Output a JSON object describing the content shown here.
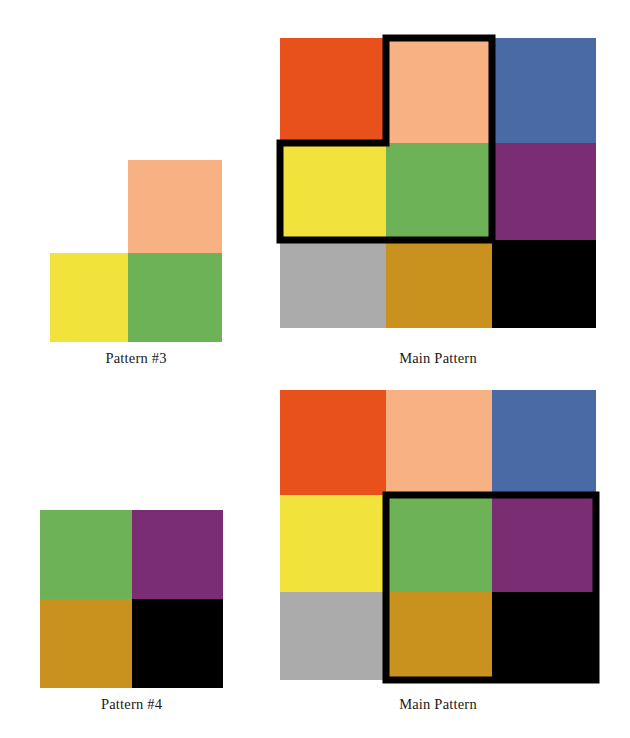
{
  "page": {
    "background": "#ffffff",
    "width": 630,
    "height": 738
  },
  "palette": {
    "orange_red": "#E8501C",
    "peach": "#F8B183",
    "blue": "#4A6AA5",
    "yellow": "#F2E23C",
    "green": "#6EB257",
    "purple": "#7A2D73",
    "gray": "#ABABAB",
    "gold": "#C9921F",
    "black": "#000000",
    "highlight_outline": "#000000"
  },
  "figures": [
    {
      "id": "pattern-3",
      "caption": "Pattern #3",
      "kind": "sub-pattern",
      "shape": "L-shape",
      "grid": {
        "rows": 2,
        "cols": 2
      },
      "tiles": [
        {
          "row": 0,
          "col": 0,
          "color": "none",
          "name": "empty"
        },
        {
          "row": 0,
          "col": 1,
          "color": "#F8B183",
          "name": "peach"
        },
        {
          "row": 1,
          "col": 0,
          "color": "#F2E23C",
          "name": "yellow"
        },
        {
          "row": 1,
          "col": 1,
          "color": "#6EB257",
          "name": "green"
        }
      ]
    },
    {
      "id": "main-pattern-top",
      "caption": "Main Pattern",
      "kind": "main-pattern",
      "grid": {
        "rows": 3,
        "cols": 3
      },
      "tiles": [
        {
          "row": 0,
          "col": 0,
          "color": "#E8501C",
          "name": "orange-red"
        },
        {
          "row": 0,
          "col": 1,
          "color": "#F8B183",
          "name": "peach"
        },
        {
          "row": 0,
          "col": 2,
          "color": "#4A6AA5",
          "name": "blue"
        },
        {
          "row": 1,
          "col": 0,
          "color": "#F2E23C",
          "name": "yellow"
        },
        {
          "row": 1,
          "col": 1,
          "color": "#6EB257",
          "name": "green"
        },
        {
          "row": 1,
          "col": 2,
          "color": "#7A2D73",
          "name": "purple"
        },
        {
          "row": 2,
          "col": 0,
          "color": "#ABABAB",
          "name": "gray"
        },
        {
          "row": 2,
          "col": 1,
          "color": "#C9921F",
          "name": "gold"
        },
        {
          "row": 2,
          "col": 2,
          "color": "#000000",
          "name": "black"
        }
      ],
      "highlight": {
        "shape": "L-shape",
        "covered_cells": [
          {
            "row": 0,
            "col": 1,
            "color": "#F8B183"
          },
          {
            "row": 1,
            "col": 0,
            "color": "#F2E23C"
          },
          {
            "row": 1,
            "col": 1,
            "color": "#6EB257"
          }
        ]
      }
    },
    {
      "id": "pattern-4",
      "caption": "Pattern #4",
      "kind": "sub-pattern",
      "shape": "square",
      "grid": {
        "rows": 2,
        "cols": 2
      },
      "tiles": [
        {
          "row": 0,
          "col": 0,
          "color": "#6EB257",
          "name": "green"
        },
        {
          "row": 0,
          "col": 1,
          "color": "#7A2D73",
          "name": "purple"
        },
        {
          "row": 1,
          "col": 0,
          "color": "#C9921F",
          "name": "gold"
        },
        {
          "row": 1,
          "col": 1,
          "color": "#000000",
          "name": "black"
        }
      ]
    },
    {
      "id": "main-pattern-bottom",
      "caption": "Main Pattern",
      "kind": "main-pattern",
      "grid": {
        "rows": 3,
        "cols": 3
      },
      "tiles": [
        {
          "row": 0,
          "col": 0,
          "color": "#E8501C",
          "name": "orange-red"
        },
        {
          "row": 0,
          "col": 1,
          "color": "#F8B183",
          "name": "peach"
        },
        {
          "row": 0,
          "col": 2,
          "color": "#4A6AA5",
          "name": "blue"
        },
        {
          "row": 1,
          "col": 0,
          "color": "#F2E23C",
          "name": "yellow"
        },
        {
          "row": 1,
          "col": 1,
          "color": "#6EB257",
          "name": "green"
        },
        {
          "row": 1,
          "col": 2,
          "color": "#7A2D73",
          "name": "purple"
        },
        {
          "row": 2,
          "col": 0,
          "color": "#ABABAB",
          "name": "gray"
        },
        {
          "row": 2,
          "col": 1,
          "color": "#C9921F",
          "name": "gold"
        },
        {
          "row": 2,
          "col": 2,
          "color": "#000000",
          "name": "black"
        }
      ],
      "highlight": {
        "shape": "square",
        "covered_cells": [
          {
            "row": 1,
            "col": 1,
            "color": "#6EB257"
          },
          {
            "row": 1,
            "col": 2,
            "color": "#7A2D73"
          },
          {
            "row": 2,
            "col": 1,
            "color": "#C9921F"
          },
          {
            "row": 2,
            "col": 2,
            "color": "#000000"
          }
        ]
      }
    }
  ],
  "captions": {
    "pattern_3": "Pattern #3",
    "main_pattern_top": "Main Pattern",
    "pattern_4": "Pattern #4",
    "main_pattern_bottom": "Main Pattern"
  }
}
